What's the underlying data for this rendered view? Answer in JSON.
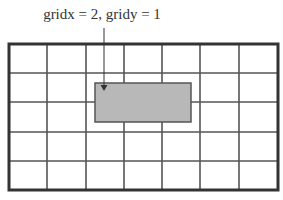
{
  "diagram": {
    "caption": "gridx = 2, gridy = 1",
    "grid": {
      "columns": 7,
      "rows": 5,
      "x_lines": [
        9,
        47,
        86,
        124,
        162,
        200,
        239,
        278
      ],
      "y_lines": [
        44,
        73,
        102,
        132,
        161,
        190
      ]
    },
    "highlight": {
      "gridx": 2,
      "gridy": 1,
      "x": 95,
      "y": 83,
      "width": 96,
      "height": 39,
      "fill": "#b8b8b8",
      "stroke": "#555555"
    },
    "arrow": {
      "x": 104,
      "y1": 28,
      "y2": 91
    },
    "colors": {
      "line": "#555555",
      "border": "#333333"
    }
  }
}
